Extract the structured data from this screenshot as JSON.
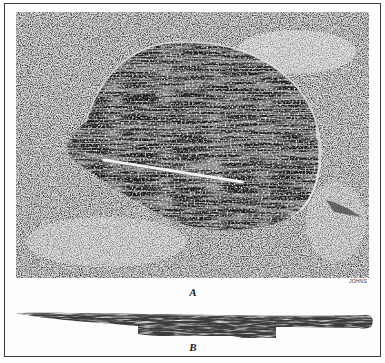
{
  "figure": {
    "panels": [
      {
        "id": "A",
        "label": "A",
        "description": "Halftone photograph of an excavated pit lined with a coiled basket, with a slender rod lying diagonally across the interior; surrounding sandy soil",
        "engraver_mark": "JOHNS"
      },
      {
        "id": "B",
        "label": "B",
        "description": "Long slender wooden rod / implement shown in profile, tapering at left, rounded at right end, with a flat projecting section beneath the middle"
      }
    ],
    "colors": {
      "ink": "#1a1a1a",
      "mid": "#7a7a7a",
      "paper": "#fdfdfd",
      "frame": "#3a3a3a"
    }
  }
}
